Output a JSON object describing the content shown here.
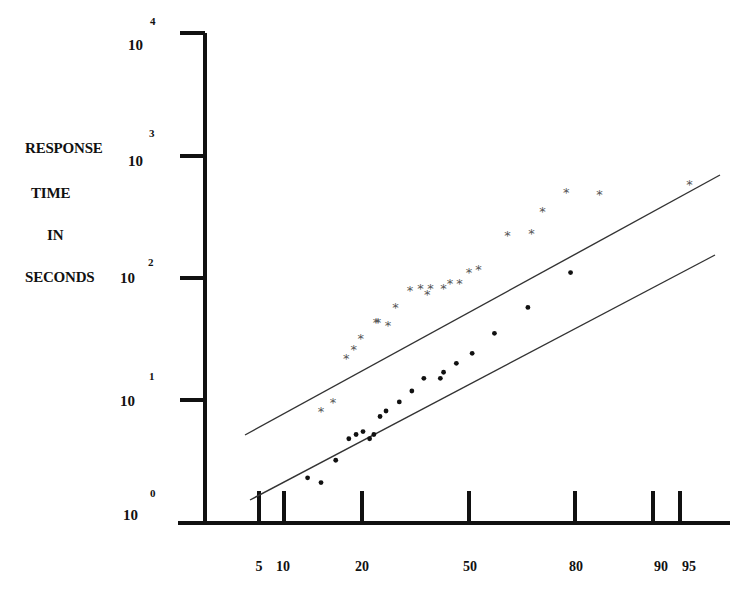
{
  "chart_data": {
    "type": "scatter",
    "title": "",
    "xlabel": "",
    "ylabel": "RESPONSE TIME IN SECONDS",
    "ylabel_lines": [
      "RESPONSE",
      "TIME",
      "IN",
      "SECONDS"
    ],
    "yscale": "log",
    "ylim": [
      1,
      10000
    ],
    "y_ticks": [
      {
        "base": "10",
        "exp": "0",
        "value": 1
      },
      {
        "base": "10",
        "exp": "1",
        "value": 10
      },
      {
        "base": "10",
        "exp": "2",
        "value": 100
      },
      {
        "base": "10",
        "exp": "3",
        "value": 1000
      },
      {
        "base": "10",
        "exp": "4",
        "value": 10000
      }
    ],
    "xscale": "probability",
    "x_ticks": [
      "5",
      "10",
      "20",
      "50",
      "80",
      "90",
      "95"
    ],
    "xlim": [
      3,
      97
    ],
    "grid": false,
    "legend": null,
    "series": [
      {
        "name": "upper (asterisks)",
        "marker": "asterisk",
        "points": [
          {
            "x": 12,
            "y": 8.1
          },
          {
            "x": 14,
            "y": 9.6
          },
          {
            "x": 16.5,
            "y": 22
          },
          {
            "x": 18,
            "y": 26
          },
          {
            "x": 19.5,
            "y": 32
          },
          {
            "x": 23,
            "y": 43
          },
          {
            "x": 23.5,
            "y": 43
          },
          {
            "x": 26,
            "y": 41
          },
          {
            "x": 28,
            "y": 57
          },
          {
            "x": 32,
            "y": 79
          },
          {
            "x": 35,
            "y": 82
          },
          {
            "x": 37,
            "y": 73
          },
          {
            "x": 38,
            "y": 82
          },
          {
            "x": 42,
            "y": 82
          },
          {
            "x": 44,
            "y": 90
          },
          {
            "x": 47,
            "y": 90
          },
          {
            "x": 50,
            "y": 111
          },
          {
            "x": 53,
            "y": 117
          },
          {
            "x": 62,
            "y": 222
          },
          {
            "x": 69,
            "y": 233
          },
          {
            "x": 72,
            "y": 353
          },
          {
            "x": 78,
            "y": 505
          },
          {
            "x": 85,
            "y": 486
          },
          {
            "x": 96,
            "y": 587
          }
        ],
        "fit_line": {
          "x": [
            3,
            97
          ],
          "y": [
            5.3,
            780
          ]
        }
      },
      {
        "name": "lower (dots)",
        "marker": "dot",
        "points": [
          {
            "x": 10,
            "y": 2.3
          },
          {
            "x": 12,
            "y": 2.1
          },
          {
            "x": 14.5,
            "y": 3.2
          },
          {
            "x": 17,
            "y": 4.8
          },
          {
            "x": 18.5,
            "y": 5.2
          },
          {
            "x": 20,
            "y": 5.5
          },
          {
            "x": 21.5,
            "y": 4.8
          },
          {
            "x": 22.5,
            "y": 5.2
          },
          {
            "x": 24,
            "y": 7.3
          },
          {
            "x": 25.5,
            "y": 8.1
          },
          {
            "x": 29,
            "y": 9.6
          },
          {
            "x": 32.5,
            "y": 11.8
          },
          {
            "x": 36,
            "y": 15.0
          },
          {
            "x": 41,
            "y": 15.0
          },
          {
            "x": 42,
            "y": 16.8
          },
          {
            "x": 46,
            "y": 19.9
          },
          {
            "x": 51,
            "y": 24
          },
          {
            "x": 58,
            "y": 35
          },
          {
            "x": 68,
            "y": 57
          },
          {
            "x": 79,
            "y": 110
          }
        ],
        "fit_line": {
          "x": [
            4,
            96
          ],
          "y": [
            1.6,
            190
          ]
        }
      }
    ]
  },
  "axes": {
    "ylabel_lines": [
      "RESPONSE",
      "TIME",
      "IN",
      "SECONDS"
    ],
    "y_ticks": [
      {
        "base": "10",
        "exp": "4"
      },
      {
        "base": "10",
        "exp": "3"
      },
      {
        "base": "10",
        "exp": "2"
      },
      {
        "base": "10",
        "exp": "1"
      },
      {
        "base": "10",
        "exp": "0"
      }
    ],
    "x_ticks": [
      "5",
      "10",
      "20",
      "50",
      "80",
      "90",
      "95"
    ]
  },
  "colors": {
    "axis": "#111111",
    "asterisk": "#555555",
    "dot": "#111111",
    "fit_line": "#333333"
  }
}
